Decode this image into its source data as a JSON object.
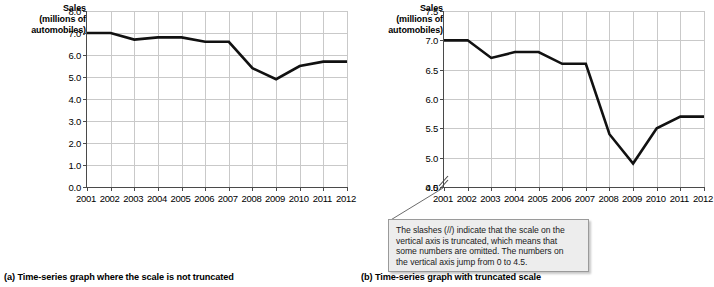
{
  "figure": {
    "panels": [
      {
        "id": "a",
        "caption": "(a) Time-series graph where the scale is not truncated",
        "axis_title_lines": [
          "Sales",
          "(millions of",
          "automobiles)"
        ],
        "truncated": false
      },
      {
        "id": "b",
        "caption": "(b) Time-series graph with truncated scale",
        "axis_title_lines": [
          "Sales",
          "(millions of",
          "automobiles)"
        ],
        "truncated": true
      }
    ],
    "callout": {
      "lines": [
        "The slashes (//) indicate that the scale on the",
        "vertical axis is truncated, which means that",
        "some numbers are omitted.  The numbers on",
        "the vertical axis jump from 0 to 4.5."
      ]
    }
  },
  "chart_data": [
    {
      "type": "line",
      "panel": "a",
      "title": "",
      "xlabel": "",
      "ylabel": "Sales (millions of automobiles)",
      "x": [
        2001,
        2002,
        2003,
        2004,
        2005,
        2006,
        2007,
        2008,
        2009,
        2010,
        2011,
        2012
      ],
      "categories": [
        "2001",
        "2002",
        "2003",
        "2004",
        "2005",
        "2006",
        "2007",
        "2008",
        "2009",
        "2010",
        "2011",
        "2012"
      ],
      "values": [
        7.0,
        7.0,
        6.7,
        6.8,
        6.8,
        6.6,
        6.6,
        5.4,
        4.9,
        5.5,
        5.7,
        5.7
      ],
      "ylim": [
        0.0,
        8.0
      ],
      "yticks": [
        0.0,
        1.0,
        2.0,
        3.0,
        4.0,
        5.0,
        6.0,
        7.0,
        8.0
      ],
      "yticklabels": [
        "0.0",
        "1.0",
        "2.0",
        "3.0",
        "4.0",
        "5.0",
        "6.0",
        "7.0",
        "8.0"
      ],
      "grid": true,
      "legend": "none",
      "axis_truncated": false
    },
    {
      "type": "line",
      "panel": "b",
      "title": "",
      "xlabel": "",
      "ylabel": "Sales (millions of automobiles)",
      "x": [
        2001,
        2002,
        2003,
        2004,
        2005,
        2006,
        2007,
        2008,
        2009,
        2010,
        2011,
        2012
      ],
      "categories": [
        "2001",
        "2002",
        "2003",
        "2004",
        "2005",
        "2006",
        "2007",
        "2008",
        "2009",
        "2010",
        "2011",
        "2012"
      ],
      "values": [
        7.0,
        7.0,
        6.7,
        6.8,
        6.8,
        6.6,
        6.6,
        5.4,
        4.9,
        5.5,
        5.7,
        5.7
      ],
      "ylim": [
        4.5,
        7.5
      ],
      "yticks": [
        4.5,
        5.0,
        5.5,
        6.0,
        6.5,
        7.0,
        7.5
      ],
      "yticklabels": [
        "4.5",
        "5.0",
        "5.5",
        "6.0",
        "6.5",
        "7.0",
        "7.5"
      ],
      "extra_ytick_label": "0.0",
      "grid": true,
      "legend": "none",
      "axis_truncated": true,
      "annotation": "The slashes (//) indicate that the scale on the vertical axis is truncated, which means that some numbers are omitted.  The numbers on the vertical axis jump from 0 to 4.5."
    }
  ]
}
